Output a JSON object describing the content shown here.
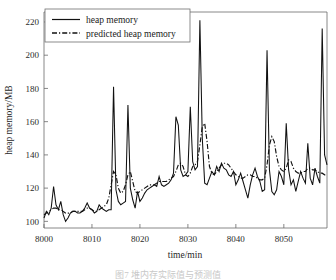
{
  "figure": {
    "caption_partial": "图7 堆内存实际值与预测值"
  },
  "legend": {
    "position": "top-left-inside",
    "entries": [
      {
        "label": "heap memory",
        "style": "solid"
      },
      {
        "label": "predicted heap memory",
        "style": "dash-dot"
      }
    ]
  },
  "colors": {
    "line": "#111111",
    "axis": "#6a6a6a",
    "background": "#ffffff"
  },
  "chart_data": {
    "type": "line",
    "title": "",
    "subtitle": "",
    "xlabel": "time/min",
    "ylabel": "heap memory/MB",
    "xlim": [
      8000,
      8059
    ],
    "ylim": [
      96,
      226
    ],
    "grid": false,
    "legend_position": "upper left",
    "xticks": [
      8000,
      8010,
      8020,
      8030,
      8040,
      8050
    ],
    "yticks": [
      100,
      120,
      140,
      160,
      180,
      200,
      220
    ],
    "x": [
      8000,
      8000.5,
      8001,
      8001.5,
      8002,
      8002.5,
      8003,
      8003.5,
      8004,
      8004.5,
      8005,
      8005.5,
      8006,
      8006.5,
      8007,
      8007.5,
      8008,
      8008.5,
      8009,
      8009.5,
      8010,
      8010.5,
      8011,
      8011.5,
      8012,
      8012.5,
      8013,
      8013.5,
      8014,
      8014.5,
      8015,
      8015.5,
      8016,
      8016.5,
      8017,
      8017.5,
      8018,
      8018.5,
      8019,
      8019.5,
      8020,
      8020.5,
      8021,
      8021.5,
      8022,
      8022.5,
      8023,
      8023.5,
      8024,
      8024.5,
      8025,
      8025.5,
      8026,
      8026.5,
      8027,
      8027.5,
      8028,
      8028.5,
      8029,
      8029.5,
      8030,
      8030.5,
      8031,
      8031.5,
      8032,
      8032.5,
      8033,
      8033.5,
      8034,
      8034.5,
      8035,
      8035.5,
      8036,
      8036.5,
      8037,
      8037.5,
      8038,
      8038.5,
      8039,
      8039.5,
      8040,
      8040.5,
      8041,
      8041.5,
      8042,
      8042.5,
      8043,
      8043.5,
      8044,
      8044.5,
      8045,
      8045.5,
      8046,
      8046.5,
      8047,
      8047.5,
      8048,
      8048.5,
      8049,
      8049.5,
      8050,
      8050.5,
      8051,
      8051.5,
      8052,
      8052.5,
      8053,
      8053.5,
      8054,
      8054.5,
      8055,
      8055.5,
      8056,
      8056.5,
      8057,
      8057.5,
      8058,
      8058.5,
      8059
    ],
    "series": [
      {
        "name": "heap memory",
        "style": "solid",
        "values": [
          102,
          106,
          104,
          108,
          121,
          110,
          107,
          112,
          104,
          100,
          102,
          105,
          106,
          106,
          105,
          105,
          106,
          108,
          111,
          108,
          107,
          105,
          106,
          110,
          108,
          107,
          106,
          107,
          107,
          181,
          119,
          112,
          110,
          111,
          112,
          170,
          120,
          113,
          108,
          118,
          112,
          114,
          117,
          119,
          120,
          121,
          122,
          121,
          127,
          122,
          121,
          122,
          123,
          125,
          129,
          163,
          158,
          131,
          127,
          128,
          130,
          169,
          136,
          131,
          133,
          221,
          150,
          123,
          122,
          126,
          130,
          128,
          133,
          130,
          135,
          132,
          131,
          128,
          127,
          130,
          122,
          125,
          129,
          124,
          119,
          114,
          122,
          128,
          132,
          127,
          124,
          118,
          119,
          203,
          131,
          118,
          116,
          119,
          130,
          127,
          122,
          159,
          131,
          122,
          125,
          118,
          124,
          130,
          126,
          123,
          147,
          126,
          122,
          132,
          127,
          123,
          216,
          140,
          134
        ]
      },
      {
        "name": "predicted heap memory",
        "style": "dash-dot",
        "values": [
          104,
          105,
          106,
          107,
          108,
          108,
          107,
          107,
          106,
          105,
          105,
          105,
          106,
          106,
          106,
          106,
          106,
          107,
          108,
          108,
          107,
          106,
          106,
          107,
          108,
          109,
          110,
          114,
          122,
          130,
          128,
          120,
          117,
          118,
          122,
          128,
          130,
          124,
          118,
          117,
          118,
          119,
          120,
          121,
          122,
          122,
          122,
          123,
          124,
          124,
          124,
          124,
          125,
          126,
          127,
          130,
          134,
          135,
          133,
          128,
          127,
          129,
          133,
          134,
          136,
          146,
          157,
          159,
          148,
          133,
          129,
          128,
          130,
          132,
          134,
          135,
          135,
          134,
          132,
          130,
          128,
          127,
          126,
          126,
          127,
          128,
          128,
          127,
          127,
          126,
          125,
          125,
          126,
          134,
          146,
          151,
          148,
          139,
          133,
          131,
          130,
          132,
          137,
          136,
          132,
          130,
          129,
          129,
          130,
          130,
          132,
          132,
          131,
          131,
          130,
          129,
          129,
          128,
          128
        ]
      }
    ]
  }
}
